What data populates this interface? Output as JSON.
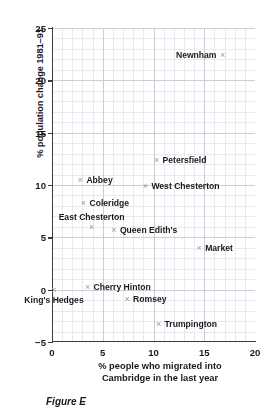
{
  "caption": "Figure E",
  "chart_data": {
    "type": "scatter",
    "title": "",
    "xlabel": "% people who migrated into Cambridge in the last year",
    "xlabel_lines": [
      "% people who migrated into",
      "Cambridge in the last year"
    ],
    "ylabel": "% population change 1981–91",
    "xlim": [
      0,
      20
    ],
    "ylim": [
      -5,
      25
    ],
    "xticks": [
      0,
      5,
      10,
      15,
      20
    ],
    "yticks": [
      -5,
      0,
      5,
      10,
      15,
      20,
      25
    ],
    "xtick_labels": [
      "0",
      "5",
      "10",
      "15",
      "20"
    ],
    "ytick_labels": [
      "−5",
      "0",
      "5",
      "10",
      "15",
      "20",
      "25"
    ],
    "grid": true,
    "grid_major_step": 5,
    "grid_minor_step": 1,
    "legend": "none",
    "marker": "×",
    "marker_color": "#9a9a9f",
    "axis_color": "#3b3b3b",
    "grid_major_color": "#c9cdd6",
    "grid_minor_color": "#e7eaf0",
    "points": [
      {
        "label": "Newnham",
        "x": 16.8,
        "y": 22.4,
        "label_pos": "left"
      },
      {
        "label": "Petersfield",
        "x": 10.3,
        "y": 12.4,
        "label_pos": "right"
      },
      {
        "label": "Abbey",
        "x": 2.8,
        "y": 10.5,
        "label_pos": "right"
      },
      {
        "label": "West Chesterton",
        "x": 9.2,
        "y": 9.9,
        "label_pos": "right"
      },
      {
        "label": "Coleridge",
        "x": 3.1,
        "y": 8.3,
        "label_pos": "right"
      },
      {
        "label": "East Chesterton",
        "x": 3.9,
        "y": 6.0,
        "label_pos": "above"
      },
      {
        "label": "Queen Edith's",
        "x": 6.1,
        "y": 5.7,
        "label_pos": "right"
      },
      {
        "label": "Market",
        "x": 14.5,
        "y": 4.0,
        "label_pos": "right"
      },
      {
        "label": "Cherry Hinton",
        "x": 3.5,
        "y": 0.3,
        "label_pos": "right"
      },
      {
        "label": "King's Hedges",
        "x": 0.2,
        "y": 0.0,
        "label_pos": "below"
      },
      {
        "label": "Romsey",
        "x": 7.4,
        "y": -0.9,
        "label_pos": "right"
      },
      {
        "label": "Trumpington",
        "x": 10.5,
        "y": -3.3,
        "label_pos": "right"
      }
    ]
  }
}
